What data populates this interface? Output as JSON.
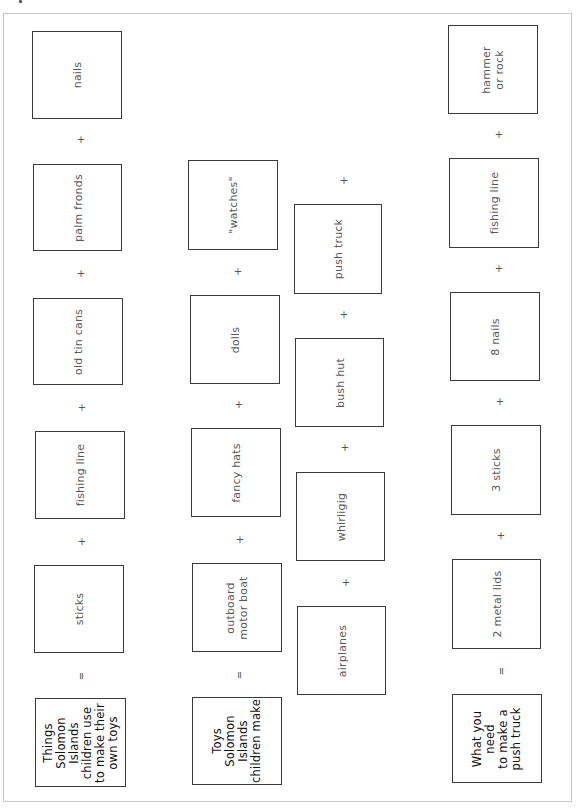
{
  "worksheet": {
    "rows": [
      {
        "label": "Things\nSolomon Islands\nchildren use\nto make their\nown toys",
        "operator_after_label": "=",
        "items": [
          "sticks",
          "fishing line",
          "old tin cans",
          "palm fronds",
          "nails"
        ],
        "operator_between_items": "+"
      },
      {
        "label": "Toys\nSolomon\nIslands\nchildren make",
        "operator_after_label": "=",
        "items": [
          "outboard\nmotor boat",
          "fancy hats",
          "dolls",
          "\"watches\""
        ],
        "operator_between_items": "+"
      },
      {
        "label": "",
        "items": [
          "airplanes",
          "whirligig",
          "bush hut",
          "push truck"
        ],
        "operator_between_items": "+"
      },
      {
        "label": "What you need\nto make a\npush truck",
        "operator_after_label": "=",
        "items": [
          "2 metal lids",
          "3 sticks",
          "8 nails",
          "fishing line",
          "hammer\nor rock"
        ],
        "operator_between_items": "+"
      }
    ],
    "operators": {
      "plus": "+",
      "equals": "="
    },
    "colors": {
      "box_border": "#3a3a3a",
      "item_text": "#5a5a5a",
      "label_text": "#111111",
      "page_border": "#c8c8c8"
    }
  }
}
